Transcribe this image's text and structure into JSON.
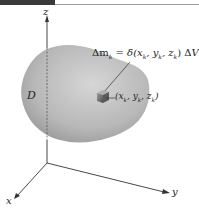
{
  "figure": {
    "axes": {
      "z_label": "z",
      "x_label": "x",
      "y_label": "y"
    },
    "region_label": "D",
    "mass_element_equation": "Δm_k = δ(x_k, y_k, z_k) ΔV_k",
    "equation_display": {
      "lhs": "Δm",
      "lhs_sub": "k",
      "rhs": "= δ(x",
      "rhs_parts": [
        "x",
        "k",
        ", y",
        "k",
        ", z",
        "k",
        ") ΔV",
        "k"
      ]
    },
    "point_label": "(x_k, y_k, z_k)",
    "point_display": [
      "(x",
      "k",
      ", y",
      "k",
      ", z",
      "k",
      ")"
    ],
    "colors": {
      "region_fill": "#a8a8a8",
      "region_light": "#d8d8d8",
      "axis": "#333333",
      "cube": "#6a6a6a"
    }
  }
}
